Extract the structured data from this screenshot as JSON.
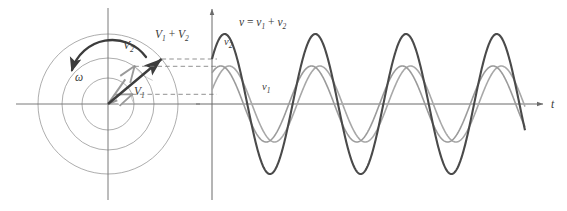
{
  "figure": {
    "background_color": "#ffffff"
  },
  "colors": {
    "axis": "#6b6b6b",
    "circle": "#8a8a8a",
    "phasor_gray": "#9a9a9a",
    "phasor_dark": "#3c3c3c",
    "wave_sum": "#4a4a4a",
    "wave_v2": "#9b9b9b",
    "wave_v1": "#a8a8a8",
    "dashed": "#7d7d7d",
    "text": "#3a3a3a"
  },
  "phasor_diagram": {
    "name": "phasor-diagram",
    "origin": {
      "x": 108,
      "y": 104
    },
    "circles": [
      {
        "label": "inner-circle",
        "radius": 26
      },
      {
        "label": "middle-circle",
        "radius": 46
      },
      {
        "label": "outer-circle",
        "radius": 70
      }
    ],
    "axes": {
      "horizontal_label": "",
      "vertical_label": ""
    },
    "vectors": [
      {
        "name": "v1-phasor",
        "label": "V",
        "subscript": "1",
        "label_text": "V₁",
        "magnitude": 26,
        "angle_deg": 22,
        "style": "gray-open-arrow"
      },
      {
        "name": "v2-phasor",
        "label": "V",
        "subscript": "2",
        "label_text": "V₂",
        "magnitude": 46,
        "angle_deg": 55,
        "style": "gray-open-arrow"
      },
      {
        "name": "resultant-phasor",
        "label": "V₁ + V₂",
        "label_parts": {
          "first": "V",
          "first_sub": "1",
          "operator": " + ",
          "second": "V",
          "second_sub": "2"
        },
        "magnitude": 70,
        "angle_deg": 40,
        "style": "dark-filled-arrow"
      }
    ],
    "rotation": {
      "name": "omega-rotation-arrow",
      "label": "ω",
      "direction": "counterclockwise",
      "arc_radius": 40
    }
  },
  "projection_lines": {
    "name": "dashed-projection-lines",
    "count": 3,
    "style": "dashed",
    "lines": [
      {
        "name": "projection-resultant",
        "from_y": 59,
        "to_y": 59
      },
      {
        "name": "projection-v2",
        "from_y": 66,
        "to_y": 66
      },
      {
        "name": "projection-v1",
        "from_y": 94,
        "to_y": 94
      }
    ]
  },
  "waveform_plot": {
    "name": "waveform-plot",
    "axis_origin": {
      "x": 212,
      "y": 104
    },
    "x_axis_label": "t",
    "y_axis_label": "",
    "x_axis_end": 545,
    "cycles_shown": 3.45,
    "curves": [
      {
        "name": "wave-sum",
        "label": "v = v₁ + v₂",
        "label_parts": {
          "v": "v",
          "eq": " = ",
          "v1": "v",
          "v1_sub": "1",
          "plus": " + ",
          "v2": "v",
          "v2_sub": "2"
        },
        "amplitude": 70,
        "phase_deg": 40,
        "color": "#4a4a4a",
        "width": 2.1
      },
      {
        "name": "wave-v2",
        "label": "v₂",
        "label_parts": {
          "v": "v",
          "sub": "2"
        },
        "amplitude": 38,
        "phase_deg": 55,
        "color": "#9b9b9b",
        "width": 1.6
      },
      {
        "name": "wave-v1",
        "label": "v₁",
        "label_parts": {
          "v": "v",
          "sub": "1"
        },
        "amplitude": 38,
        "phase_deg": 22,
        "color": "#a8a8a8",
        "width": 1.6
      }
    ]
  },
  "chart_data": {
    "type": "line",
    "xlabel": "t",
    "ylabel": "",
    "series": [
      {
        "name": "v₁",
        "amplitude": 38,
        "phase_deg": 22,
        "description": "first sinusoid, lagging"
      },
      {
        "name": "v₂",
        "amplitude": 38,
        "phase_deg": 55,
        "description": "second sinusoid, leading"
      },
      {
        "name": "v = v₁ + v₂",
        "amplitude": 70,
        "phase_deg": 40,
        "description": "resultant sum waveform"
      }
    ],
    "legend_position": "inline-annotations",
    "grid": false
  }
}
